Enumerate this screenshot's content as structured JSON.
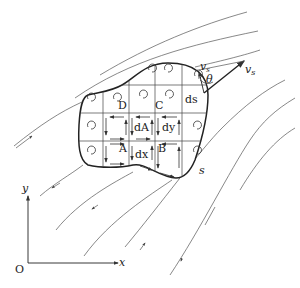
{
  "diagram": {
    "type": "stokes-theorem-circulation-region",
    "labels": {
      "corner_D": "D",
      "corner_C": "C",
      "corner_A": "A",
      "corner_B": "B",
      "area_element": "dA",
      "dx": "dx",
      "dy": "dy",
      "ds": "ds",
      "boundary": "s",
      "velocity": "v",
      "velocity_sub": "s",
      "velocity_tangent": "v",
      "velocity_tangent_sub": "s",
      "velocity_tangent_prime": "'",
      "angle": "θ"
    },
    "axes": {
      "origin": "O",
      "x_label": "x",
      "y_label": "y"
    },
    "colors": {
      "ink": "#222222",
      "streamline": "#555555",
      "background": "#ffffff"
    }
  }
}
